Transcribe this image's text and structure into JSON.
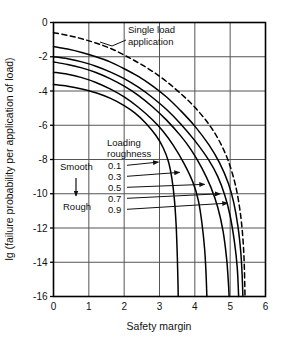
{
  "chart_data": {
    "type": "line",
    "title": "",
    "xlabel": "Safety margin",
    "ylabel": "lg (failure probability per application of load)",
    "xlim": [
      0,
      6
    ],
    "ylim": [
      -16,
      0
    ],
    "grid": true,
    "legend_position": "inside-left",
    "xticks": [
      "0",
      "1",
      "2",
      "3",
      "4",
      "5",
      "6"
    ],
    "yticks": [
      "0",
      "-2",
      "-4",
      "-6",
      "-8",
      "-10",
      "-12",
      "-14",
      "-16"
    ],
    "annotations": [
      {
        "id": "single-load",
        "text": "Single load\napplication",
        "line1": "Single load",
        "line2": "application"
      },
      {
        "id": "loading-roughness",
        "text": "Loading\nroughness",
        "line1": "Loading",
        "line2": "roughness"
      },
      {
        "id": "smooth",
        "text": "Smooth"
      },
      {
        "id": "rough",
        "text": "Rough"
      }
    ],
    "series": [
      {
        "name": "Single load application",
        "label": "",
        "style": "dashed",
        "points": [
          [
            0.0,
            -0.6
          ],
          [
            0.4,
            -0.75
          ],
          [
            0.8,
            -0.95
          ],
          [
            1.2,
            -1.2
          ],
          [
            1.6,
            -1.5
          ],
          [
            2.0,
            -1.9
          ],
          [
            2.4,
            -2.35
          ],
          [
            2.8,
            -2.85
          ],
          [
            3.2,
            -3.45
          ],
          [
            3.6,
            -4.15
          ],
          [
            4.0,
            -4.95
          ],
          [
            4.4,
            -5.95
          ],
          [
            4.7,
            -6.95
          ],
          [
            4.95,
            -8.1
          ],
          [
            5.15,
            -9.5
          ],
          [
            5.28,
            -11.0
          ],
          [
            5.36,
            -12.6
          ],
          [
            5.4,
            -14.2
          ],
          [
            5.42,
            -16.0
          ]
        ]
      },
      {
        "name": "Loading roughness 0.1",
        "label": "0.1",
        "style": "solid",
        "points": [
          [
            0.0,
            -1.4
          ],
          [
            0.4,
            -1.55
          ],
          [
            0.8,
            -1.75
          ],
          [
            1.2,
            -2.0
          ],
          [
            1.6,
            -2.3
          ],
          [
            2.0,
            -2.7
          ],
          [
            2.4,
            -3.15
          ],
          [
            2.8,
            -3.7
          ],
          [
            3.2,
            -4.35
          ],
          [
            3.6,
            -5.15
          ],
          [
            4.0,
            -6.05
          ],
          [
            4.4,
            -7.15
          ],
          [
            4.7,
            -8.2
          ],
          [
            4.95,
            -9.4
          ],
          [
            5.1,
            -10.5
          ],
          [
            5.22,
            -11.9
          ],
          [
            5.3,
            -13.4
          ],
          [
            5.34,
            -14.8
          ],
          [
            5.36,
            -16.0
          ]
        ]
      },
      {
        "name": "Loading roughness 0.3",
        "label": "0.3",
        "style": "solid",
        "points": [
          [
            0.0,
            -2.0
          ],
          [
            0.4,
            -2.12
          ],
          [
            0.8,
            -2.3
          ],
          [
            1.2,
            -2.55
          ],
          [
            1.6,
            -2.88
          ],
          [
            2.0,
            -3.28
          ],
          [
            2.4,
            -3.78
          ],
          [
            2.8,
            -4.38
          ],
          [
            3.2,
            -5.08
          ],
          [
            3.6,
            -5.92
          ],
          [
            4.0,
            -6.9
          ],
          [
            4.4,
            -8.05
          ],
          [
            4.65,
            -9.0
          ],
          [
            4.85,
            -10.1
          ],
          [
            5.0,
            -11.3
          ],
          [
            5.12,
            -12.8
          ],
          [
            5.2,
            -14.3
          ],
          [
            5.24,
            -16.0
          ]
        ]
      },
      {
        "name": "Loading roughness 0.5",
        "label": "0.5",
        "style": "solid",
        "points": [
          [
            0.0,
            -2.3
          ],
          [
            0.4,
            -2.45
          ],
          [
            0.8,
            -2.65
          ],
          [
            1.2,
            -2.92
          ],
          [
            1.6,
            -3.28
          ],
          [
            2.0,
            -3.72
          ],
          [
            2.4,
            -4.25
          ],
          [
            2.8,
            -4.92
          ],
          [
            3.2,
            -5.7
          ],
          [
            3.6,
            -6.62
          ],
          [
            3.9,
            -7.45
          ],
          [
            4.2,
            -8.5
          ],
          [
            4.45,
            -9.6
          ],
          [
            4.65,
            -10.8
          ],
          [
            4.8,
            -12.2
          ],
          [
            4.9,
            -13.8
          ],
          [
            4.95,
            -15.2
          ],
          [
            4.97,
            -16.0
          ]
        ]
      },
      {
        "name": "Loading roughness 0.7",
        "label": "0.7",
        "style": "solid",
        "points": [
          [
            0.0,
            -2.9
          ],
          [
            0.4,
            -3.02
          ],
          [
            0.8,
            -3.22
          ],
          [
            1.2,
            -3.5
          ],
          [
            1.6,
            -3.88
          ],
          [
            2.0,
            -4.35
          ],
          [
            2.4,
            -4.95
          ],
          [
            2.8,
            -5.68
          ],
          [
            3.1,
            -6.35
          ],
          [
            3.4,
            -7.2
          ],
          [
            3.7,
            -8.25
          ],
          [
            3.95,
            -9.35
          ],
          [
            4.1,
            -10.4
          ],
          [
            4.2,
            -11.7
          ],
          [
            4.28,
            -13.3
          ],
          [
            4.32,
            -14.8
          ],
          [
            4.34,
            -16.0
          ]
        ]
      },
      {
        "name": "Loading roughness 0.9",
        "label": "0.9",
        "style": "solid",
        "points": [
          [
            0.0,
            -3.62
          ],
          [
            0.4,
            -3.72
          ],
          [
            0.8,
            -3.88
          ],
          [
            1.2,
            -4.1
          ],
          [
            1.6,
            -4.42
          ],
          [
            2.0,
            -4.85
          ],
          [
            2.3,
            -5.28
          ],
          [
            2.6,
            -5.85
          ],
          [
            2.9,
            -6.6
          ],
          [
            3.1,
            -7.3
          ],
          [
            3.25,
            -8.1
          ],
          [
            3.35,
            -9.1
          ],
          [
            3.42,
            -10.3
          ],
          [
            3.47,
            -11.8
          ],
          [
            3.5,
            -13.4
          ],
          [
            3.52,
            -14.9
          ],
          [
            3.53,
            -16.0
          ]
        ]
      }
    ],
    "colors": {
      "curve": "#000000",
      "axis": "#000000",
      "grid": "#555555",
      "background": "#ffffff",
      "text": "#111111"
    }
  }
}
